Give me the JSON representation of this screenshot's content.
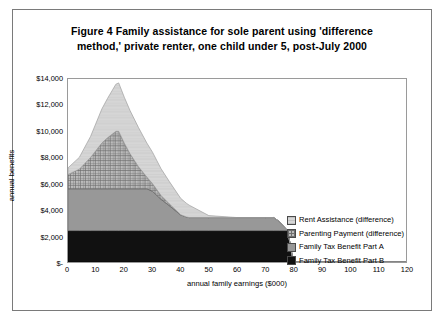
{
  "figure": {
    "title_line1": "Figure 4   Family assistance for sole parent using 'difference",
    "title_line2": "method,' private renter, one child under 5, post-July 2000"
  },
  "legend": {
    "position": "inside-right",
    "items": [
      {
        "label": "Rent Assistance (difference)",
        "fill": "#d4d4d4",
        "pattern": "light-hatch"
      },
      {
        "label": "Parenting Payment (difference)",
        "fill": "#b0b0b0",
        "pattern": "cross-hatch"
      },
      {
        "label": "Family Tax Benefit Part A",
        "fill": "#989898",
        "pattern": "solid"
      },
      {
        "label": "Family Tax Benefit Part B",
        "fill": "#111111",
        "pattern": "solid"
      }
    ]
  },
  "chart_data": {
    "type": "area",
    "stacked": true,
    "title": "Figure 4   Family assistance for sole parent using 'difference method,' private renter, one child under 5, post-July 2000",
    "xlabel": "annual family earnings ($000)",
    "ylabel": "annual benefits",
    "xlim": [
      0,
      120
    ],
    "ylim": [
      0,
      14000
    ],
    "xticks": [
      0,
      10,
      20,
      30,
      40,
      50,
      60,
      70,
      80,
      90,
      100,
      110,
      120
    ],
    "ytick_labels": [
      "$-",
      "$2,000",
      "$4,000",
      "$6,000",
      "$8,000",
      "$10,000",
      "$12,000",
      "$14,000"
    ],
    "ytick_values": [
      0,
      2000,
      4000,
      6000,
      8000,
      10000,
      12000,
      14000
    ],
    "grid": false,
    "x": [
      0,
      4,
      8,
      12,
      14,
      17,
      18,
      20,
      22,
      25,
      28,
      30,
      33,
      36,
      40,
      42,
      43,
      50,
      60,
      70,
      73,
      75,
      78,
      80,
      90,
      100,
      110,
      120
    ],
    "series": [
      {
        "name": "Family Tax Benefit Part B",
        "fill": "#111111",
        "values": [
          2400,
          2400,
          2400,
          2400,
          2400,
          2400,
          2400,
          2400,
          2400,
          2400,
          2400,
          2400,
          2400,
          2400,
          2400,
          2400,
          2400,
          2400,
          2400,
          2400,
          2400,
          2400,
          2400,
          0,
          0,
          0,
          0,
          0
        ]
      },
      {
        "name": "Family Tax Benefit Part A",
        "fill": "#989898",
        "values": [
          3200,
          3200,
          3200,
          3200,
          3200,
          3200,
          3200,
          3200,
          3200,
          3200,
          3200,
          3000,
          2400,
          1900,
          1200,
          1050,
          1000,
          1000,
          1000,
          1000,
          1000,
          700,
          0,
          0,
          0,
          0,
          0,
          0
        ]
      },
      {
        "name": "Parenting Payment (difference)",
        "fill": "#b0b0b0",
        "values": [
          1100,
          1500,
          2400,
          3500,
          3900,
          4400,
          4400,
          3500,
          2700,
          1700,
          900,
          600,
          300,
          150,
          20,
          0,
          0,
          0,
          0,
          0,
          0,
          0,
          0,
          0,
          0,
          0,
          0,
          0
        ]
      },
      {
        "name": "Rent Assistance (difference)",
        "fill": "#d4d4d4",
        "values": [
          500,
          900,
          1600,
          2600,
          3000,
          3600,
          3700,
          3500,
          3300,
          3000,
          2600,
          2400,
          2050,
          1700,
          1250,
          1050,
          950,
          150,
          0,
          0,
          0,
          0,
          0,
          0,
          0,
          0,
          0,
          0
        ]
      }
    ]
  }
}
